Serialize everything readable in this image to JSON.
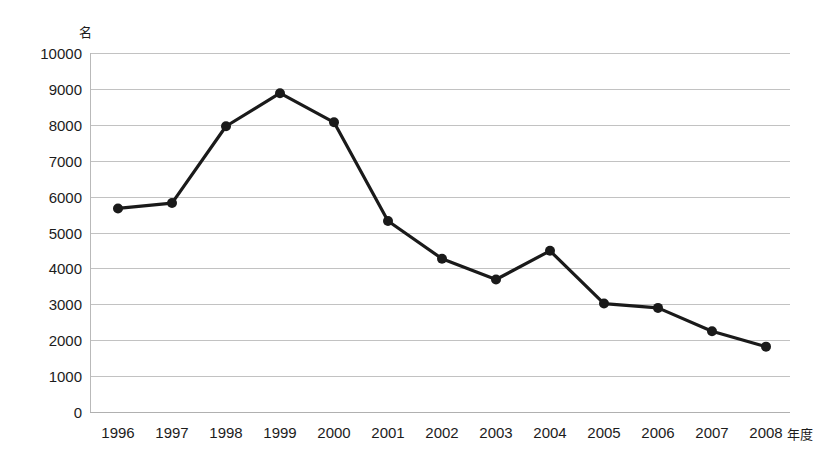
{
  "chart_data": {
    "type": "line",
    "title": "",
    "subtitle": "",
    "xlabel": "年度",
    "ylabel": "名",
    "categories": [
      "1996",
      "1997",
      "1998",
      "1999",
      "2000",
      "2001",
      "2002",
      "2003",
      "2004",
      "2005",
      "2006",
      "2007",
      "2008"
    ],
    "values": [
      5670,
      5820,
      7960,
      8880,
      8070,
      5320,
      4270,
      3690,
      4490,
      3020,
      2900,
      2250,
      1820
    ],
    "series": [
      {
        "name": "",
        "values": [
          5670,
          5820,
          7960,
          8880,
          8070,
          5320,
          4270,
          3690,
          4490,
          3020,
          2900,
          2250,
          1820
        ]
      }
    ],
    "ylim": [
      0,
      10000
    ],
    "ytick_step": 1000,
    "yticks": [
      "10000",
      "9000",
      "8000",
      "7000",
      "6000",
      "5000",
      "4000",
      "3000",
      "2000",
      "1000",
      "0"
    ],
    "ytick_values": [
      10000,
      9000,
      8000,
      7000,
      6000,
      5000,
      4000,
      3000,
      2000,
      1000,
      0
    ],
    "grid": true,
    "grid_axis": "y",
    "legend": false,
    "legend_position": "none",
    "line_color": "#1a1a1a",
    "marker_color": "#1a1a1a",
    "marker_shape": "circle",
    "grid_color": "#c2c2c2",
    "axis_color": "#b9b9b9",
    "background_color": "#ffffff",
    "text_color": "#1c1c1c"
  },
  "axis": {
    "y_unit": "名",
    "x_unit": "年度"
  }
}
